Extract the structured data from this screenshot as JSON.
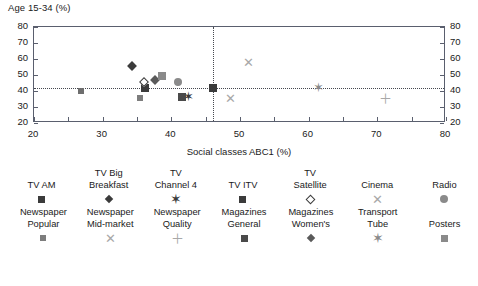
{
  "chart_data": {
    "type": "scatter",
    "title": "Age 15-34 (%)",
    "xlabel": "Social classes ABC1 (%)",
    "ylabel": "Age 15-34 (%)",
    "xlim": [
      20,
      80
    ],
    "ylim": [
      20,
      80
    ],
    "xticks": [
      20,
      30,
      40,
      50,
      60,
      70,
      80
    ],
    "yticks": [
      20,
      30,
      40,
      50,
      60,
      70,
      80
    ],
    "xticks_minor_step": 5,
    "grid": false,
    "dual_y_axis": true,
    "reference_lines": {
      "horizontal_y": 42,
      "vertical_x": 46
    },
    "legend_position": "below",
    "points": [
      {
        "label": "TV AM",
        "x": 36.2,
        "y": 42.0,
        "marker": "square",
        "color": "#3b3b3b"
      },
      {
        "label": "TV Big Breakfast",
        "x": 34.2,
        "y": 55.5,
        "marker": "diamond",
        "color": "#3b3b3b"
      },
      {
        "label": "TV Channel 4",
        "x": 42.5,
        "y": 36.0,
        "marker": "star",
        "color": "#3b3b3b"
      },
      {
        "label": "TV ITV",
        "x": 46.0,
        "y": 42.0,
        "marker": "square",
        "color": "#3b3b3b"
      },
      {
        "label": "TV Satellite",
        "x": 36.0,
        "y": 45.5,
        "marker": "diamond-open",
        "color": "#ffffff"
      },
      {
        "label": "Cinema",
        "x": 51.3,
        "y": 57.8,
        "marker": "x",
        "color": "#a8a8a8"
      },
      {
        "label": "Radio",
        "x": 41.0,
        "y": 45.5,
        "marker": "circle",
        "color": "#8a8a8a"
      },
      {
        "label": "Newspaper Popular",
        "x": 35.4,
        "y": 35.6,
        "marker": "square-small",
        "color": "#7d7d7d"
      },
      {
        "label": "Newspaper Mid-market",
        "x": 48.6,
        "y": 34.8,
        "marker": "x",
        "color": "#a8a8a8"
      },
      {
        "label": "Newspaper Quality",
        "x": 71.2,
        "y": 35.0,
        "marker": "plus",
        "color": "#a8a8a8"
      },
      {
        "label": "Magazines General",
        "x": 41.6,
        "y": 36.2,
        "marker": "square",
        "color": "#4a4a4a"
      },
      {
        "label": "Magazines Women's",
        "x": 37.6,
        "y": 46.8,
        "marker": "diamond",
        "color": "#5a5a5a"
      },
      {
        "label": "Transport Tube",
        "x": 61.5,
        "y": 42.0,
        "marker": "star",
        "color": "#8a8a8a"
      },
      {
        "label": "Posters",
        "x": 38.6,
        "y": 49.5,
        "marker": "square",
        "color": "#8a8a8a"
      },
      {
        "label": "Newspaper Popular",
        "x": 26.9,
        "y": 40.3,
        "marker": "square-small",
        "color": "#6e6e6e"
      }
    ]
  },
  "legend": {
    "row1": [
      {
        "line1": "",
        "line2": "TV AM",
        "marker": "square",
        "color": "#3b3b3b"
      },
      {
        "line1": "TV Big",
        "line2": "Breakfast",
        "marker": "diamond",
        "color": "#3b3b3b"
      },
      {
        "line1": "TV",
        "line2": "Channel 4",
        "marker": "star",
        "color": "#3b3b3b"
      },
      {
        "line1": "",
        "line2": "TV ITV",
        "marker": "square",
        "color": "#3b3b3b"
      },
      {
        "line1": "TV",
        "line2": "Satellite",
        "marker": "diamond-open",
        "color": "#ffffff"
      },
      {
        "line1": "",
        "line2": "Cinema",
        "marker": "x",
        "color": "#a8a8a8"
      },
      {
        "line1": "",
        "line2": "Radio",
        "marker": "circle",
        "color": "#8a8a8a"
      }
    ],
    "row2": [
      {
        "line1": "Newspaper",
        "line2": "Popular",
        "marker": "square-small",
        "color": "#7d7d7d"
      },
      {
        "line1": "Newspaper",
        "line2": "Mid-market",
        "marker": "x",
        "color": "#a8a8a8"
      },
      {
        "line1": "Newspaper",
        "line2": "Quality",
        "marker": "plus",
        "color": "#a8a8a8"
      },
      {
        "line1": "Magazines",
        "line2": "General",
        "marker": "square",
        "color": "#4a4a4a"
      },
      {
        "line1": "Magazines",
        "line2": "Women's",
        "marker": "diamond",
        "color": "#5a5a5a"
      },
      {
        "line1": "Transport",
        "line2": "Tube",
        "marker": "star",
        "color": "#8a8a8a"
      },
      {
        "line1": "",
        "line2": "Posters",
        "marker": "square",
        "color": "#8a8a8a"
      }
    ]
  }
}
